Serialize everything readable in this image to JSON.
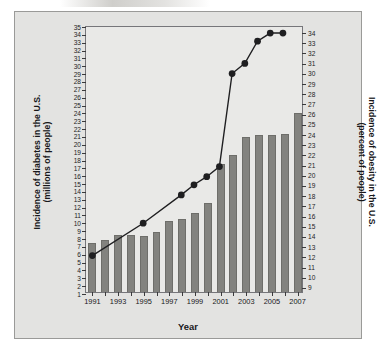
{
  "figure": {
    "xtitle": "Year",
    "ytitle_left_line1": "Incidence of diabetes in the U.S.",
    "ytitle_left_line2": "(millions of people)",
    "ytitle_right_line1": "Incidence of obesity in the U.S.",
    "ytitle_right_line2": "(percent of people)",
    "bar_color": "#83837f",
    "line_color": "#1f1f21",
    "plot_bg": "#e9e9e7",
    "page_bg": "#e3e3e1"
  },
  "chart_data": {
    "type": "bar",
    "title": "",
    "xlabel": "Year",
    "grid": false,
    "legend": "none",
    "x": [
      1991,
      1992,
      1993,
      1994,
      1995,
      1996,
      1997,
      1998,
      1999,
      2000,
      2001,
      2002,
      2003,
      2004,
      2005,
      2006,
      2007
    ],
    "xtick_labels": [
      "1991",
      "1993",
      "1995",
      "1997",
      "1999",
      "2001",
      "2003",
      "2005",
      "2007"
    ],
    "xtick_values": [
      1991,
      1993,
      1995,
      1997,
      1999,
      2001,
      2003,
      2005,
      2007
    ],
    "left_axis": {
      "label_line1": "Incidence of diabetes in the U.S.",
      "label_line2": "(millions of people)",
      "ylim": [
        1,
        35
      ],
      "tick_step": 1,
      "ticks": [
        1,
        2,
        3,
        4,
        5,
        6,
        7,
        8,
        9,
        10,
        11,
        12,
        13,
        14,
        15,
        16,
        17,
        18,
        19,
        20,
        21,
        22,
        23,
        24,
        25,
        26,
        27,
        28,
        29,
        30,
        31,
        32,
        33,
        34,
        35
      ]
    },
    "right_axis": {
      "label_line1": "Incidence of obesity in the U.S.",
      "label_line2": "(percent of people)",
      "ylim": [
        8.4,
        34.6
      ],
      "tick_step": 1,
      "ticks": [
        9,
        10,
        11,
        12,
        13,
        14,
        15,
        16,
        17,
        18,
        19,
        20,
        21,
        22,
        23,
        24,
        25,
        26,
        27,
        28,
        29,
        30,
        31,
        32,
        33,
        34
      ]
    },
    "series": [
      {
        "name": "Incidence of diabetes in the U.S. (millions of people)",
        "type": "bar",
        "axis": "left",
        "color": "#83837f",
        "values": [
          7.2,
          7.6,
          8.2,
          8.3,
          8.1,
          8.7,
          10.1,
          10.3,
          11.1,
          12.3,
          17.3,
          18.4,
          20.7,
          21.0,
          21.0,
          21.1,
          23.8
        ]
      },
      {
        "name": "Incidence of obesity in the U.S. (percent of people)",
        "type": "line",
        "axis": "right",
        "color": "#1f1f21",
        "marker": "filled-circle",
        "values": [
          12.0,
          null,
          null,
          null,
          15.2,
          null,
          null,
          18.0,
          19.0,
          19.8,
          20.8,
          30.0,
          31.0,
          33.2,
          34.0,
          34.0,
          null
        ]
      }
    ]
  }
}
